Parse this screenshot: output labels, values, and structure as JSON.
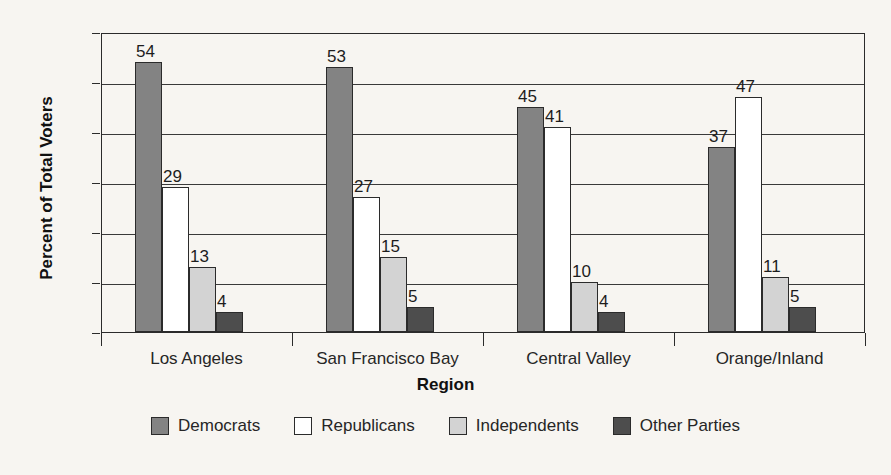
{
  "chart_data": {
    "type": "bar",
    "title": "",
    "xlabel": "Region",
    "ylabel": "Percent of Total Voters",
    "categories": [
      "Los Angeles",
      "San Francisco Bay",
      "Central Valley",
      "Orange/Inland"
    ],
    "series": [
      {
        "name": "Democrats",
        "color": "#838383",
        "values": [
          54,
          53,
          45,
          37
        ]
      },
      {
        "name": "Republicans",
        "color": "#ffffff",
        "values": [
          29,
          27,
          41,
          47
        ]
      },
      {
        "name": "Independents",
        "color": "#d3d3d3",
        "values": [
          13,
          15,
          10,
          11
        ]
      },
      {
        "name": "Other Parties",
        "color": "#4d4d4d",
        "values": [
          4,
          5,
          4,
          5
        ]
      }
    ],
    "ylim": [
      0,
      60
    ],
    "yticks": [
      0,
      10,
      20,
      30,
      40,
      50,
      60
    ],
    "grid": true,
    "legend_position": "bottom",
    "data_labels": true
  }
}
